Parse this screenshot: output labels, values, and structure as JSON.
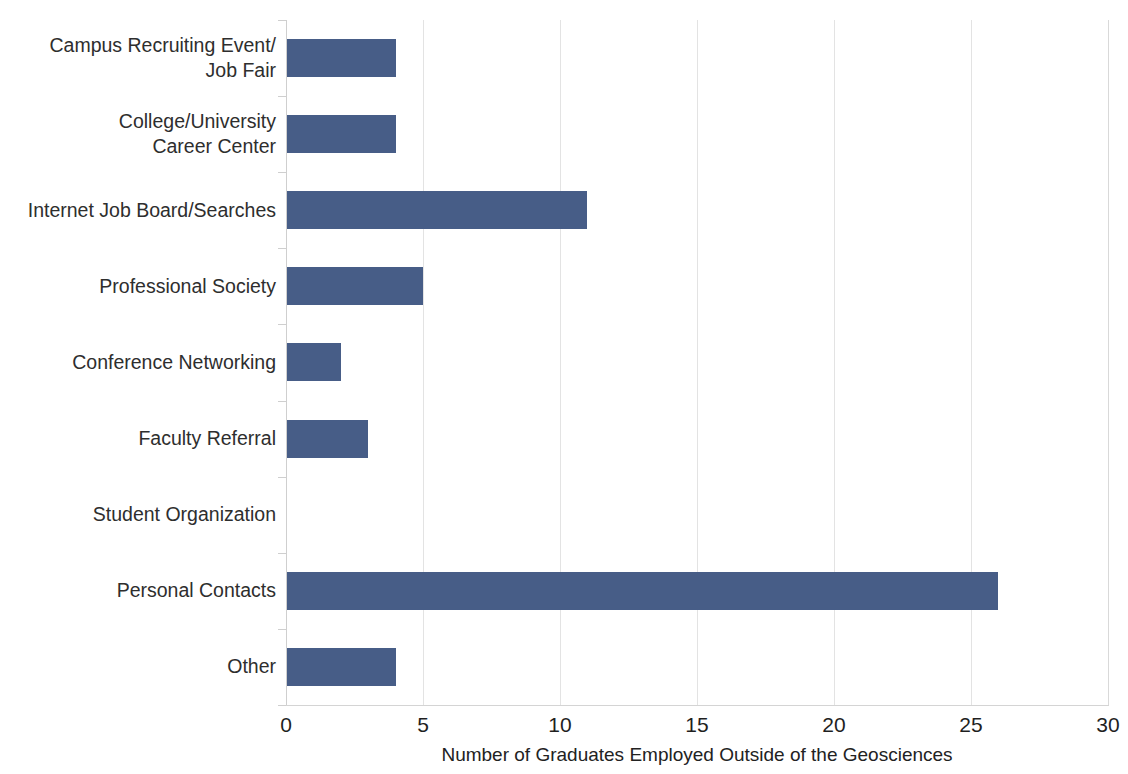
{
  "chart_data": {
    "type": "bar",
    "orientation": "horizontal",
    "title": "",
    "subtitle": "",
    "xlabel": "Number of Graduates Employed Outside of the Geosciences",
    "ylabel": "",
    "categories": [
      "Campus Recruiting Event/\nJob Fair",
      "College/University\nCareer Center",
      "Internet Job Board/Searches",
      "Professional Society",
      "Conference Networking",
      "Faculty Referral",
      "Student Organization",
      "Personal Contacts",
      "Other"
    ],
    "values": [
      4,
      4,
      11,
      5,
      2,
      3,
      0,
      26,
      4
    ],
    "xlim": [
      0,
      30
    ],
    "xticks": [
      0,
      5,
      10,
      15,
      20,
      25,
      30
    ],
    "xtick_labels": [
      "0",
      "5",
      "10",
      "15",
      "20",
      "25",
      "30"
    ],
    "grid": "vertical",
    "legend": "none",
    "bar_color": "#475d87",
    "gridline_color": "#e3e3e3",
    "axis_color": "#cfcfcf",
    "background_color": "#ffffff",
    "text_color": "#2e2e2e"
  }
}
